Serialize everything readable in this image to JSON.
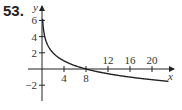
{
  "problem_number": "53.",
  "chart_data": {
    "type": "line",
    "title": "",
    "xlabel": "x",
    "ylabel": "y",
    "x_ticks": [
      4,
      8,
      12,
      16,
      20
    ],
    "y_ticks": [
      -2,
      2,
      4,
      6
    ],
    "xlim": [
      0,
      24
    ],
    "ylim": [
      -3,
      7
    ],
    "grid": false,
    "legend": null,
    "series": [
      {
        "name": "curve",
        "function": "y = -log2(x/8)",
        "x": [
          0.125,
          0.25,
          0.5,
          1,
          2,
          4,
          8,
          12,
          16,
          20,
          23
        ],
        "y": [
          6,
          5,
          4,
          3,
          2,
          1,
          0,
          -0.58,
          -1,
          -1.32,
          -1.52
        ]
      }
    ],
    "color": "#222222"
  }
}
